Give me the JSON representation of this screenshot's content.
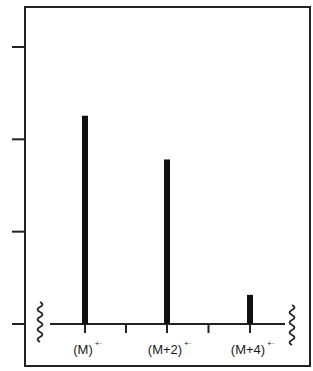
{
  "chart_data": {
    "type": "bar",
    "title": "",
    "xlabel": "",
    "ylabel": "",
    "categories": [
      "(M)",
      "(M+2)",
      "(M+4)"
    ],
    "category_superscripts": [
      "+·",
      "+·",
      "+·"
    ],
    "values": [
      100,
      79,
      14
    ],
    "ylim": [
      0,
      133
    ],
    "y_ticks": 4,
    "y_tick_labels": [],
    "grid": false,
    "legend": null,
    "axis_break_marks": true,
    "bar_color": "#111111",
    "frame_color": "#222222"
  }
}
